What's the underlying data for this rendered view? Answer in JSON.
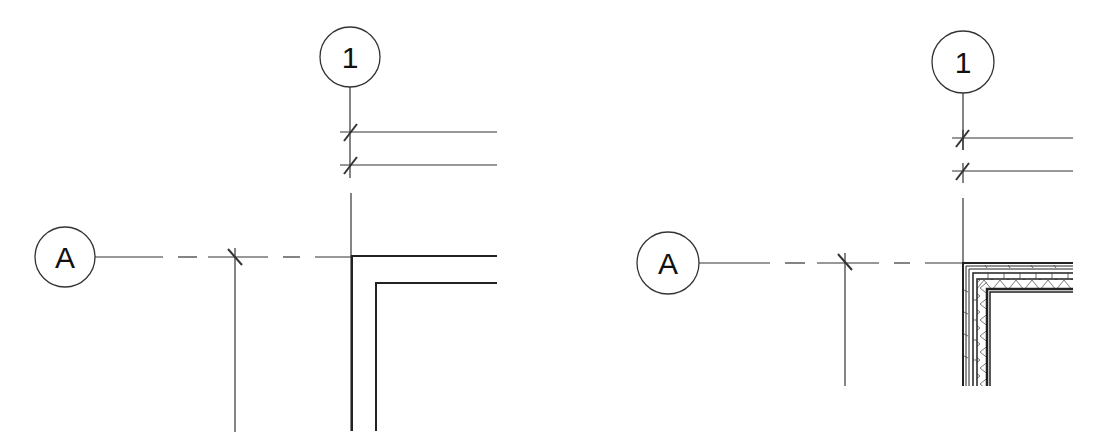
{
  "diagram": {
    "type": "architectural-plan-detail",
    "panels": [
      {
        "id": "simple-wall",
        "grid_bubbles": {
          "vertical": "1",
          "horizontal": "A"
        },
        "wall_style": "two-line"
      },
      {
        "id": "detailed-wall",
        "grid_bubbles": {
          "vertical": "1",
          "horizontal": "A"
        },
        "wall_style": "layered-with-insulation-hatch"
      }
    ],
    "colors": {
      "line": "#222222",
      "background": "#ffffff"
    }
  }
}
